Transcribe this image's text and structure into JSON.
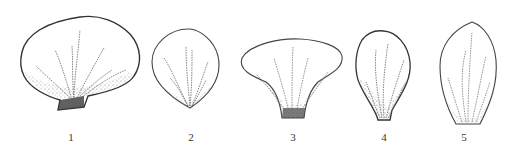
{
  "figure": {
    "ink_color": "#3a3a3a",
    "petals": [
      {
        "id": 1,
        "label": "1",
        "shape": "broad-reniform with short claw"
      },
      {
        "id": 2,
        "label": "2",
        "shape": "broadly ovate-rounded"
      },
      {
        "id": 3,
        "label": "3",
        "shape": "flabellate (fan-shaped)"
      },
      {
        "id": 4,
        "label": "4",
        "shape": "obovate with short claw"
      },
      {
        "id": 5,
        "label": "5",
        "shape": "elliptic-ovate, acute apex"
      }
    ]
  }
}
